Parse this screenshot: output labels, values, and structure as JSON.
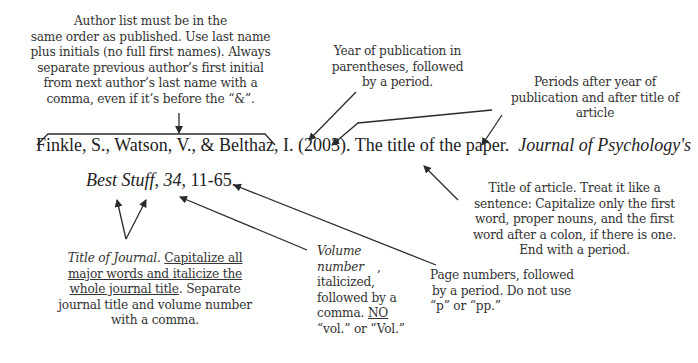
{
  "citation": {
    "authors": "Finkle, S., Watson, V., & Belthaz, I.",
    "year": "(2003).",
    "article_title": "The title of the paper.",
    "journal_line1": "Journal of Psychology's",
    "journal_line2": "Best Stuff",
    "sep1": ", ",
    "volume": "34",
    "sep2": ", ",
    "pages": "11-65."
  },
  "annotations": {
    "authors": {
      "lines": [
        "Author list must be in the",
        "same order as published. Use last name",
        "plus initials (no full first names). Always",
        "separate previous author’s first initial",
        "from next author’s last name with a",
        "comma, even if it’s before the “&”."
      ]
    },
    "year": {
      "lines": [
        "Year of publication in",
        "parentheses, followed",
        "by a period."
      ]
    },
    "periods": {
      "lines": [
        "Periods after year of",
        "publication and after title of",
        "article"
      ]
    },
    "article_title": {
      "lines": [
        "Title of article. Treat it like a",
        "sentence: Capitalize only the first",
        "word, proper nouns, and the first",
        "word after a colon, if there is one.",
        "End with a period."
      ]
    },
    "journal": {
      "italic_part": "Title of Journal",
      "after_italic": ". ",
      "underlined_part": "Capitalize all major words and italicize the whole journal title",
      "rest": ". Separate journal title and volume number with a comma."
    },
    "volume": {
      "italic_part": "Volume number",
      "after_italic": ",",
      "line3": "italicized,",
      "line4": "followed by a",
      "line5_prefix": "comma. ",
      "line5_underlined": "NO",
      "line6": "“vol.” or “Vol.”"
    },
    "pages": {
      "lines": [
        "Page numbers, followed",
        "by a period. Do not use",
        "“p” or “pp.”"
      ]
    }
  },
  "colors": {
    "ink": "#222222",
    "arrow": "#2b2b2b",
    "background": "#ffffff"
  }
}
